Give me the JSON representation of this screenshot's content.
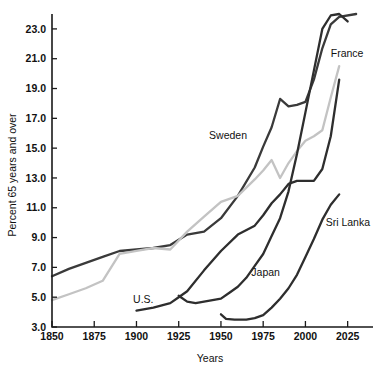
{
  "chart_data": {
    "type": "line",
    "title": "",
    "xlabel": "Years",
    "ylabel": "Percent 65 years and over",
    "xlim": [
      1850,
      2040
    ],
    "ylim": [
      3.0,
      24.0
    ],
    "grid": false,
    "legend_position": "inline-labels",
    "xticks": [
      1850,
      1875,
      1900,
      1925,
      1950,
      1975,
      2000,
      2025
    ],
    "xtick_labels": [
      "1850",
      "1875",
      "1900",
      "1925",
      "1950",
      "1975",
      "2000",
      "2025"
    ],
    "yticks": [
      3.0,
      5.0,
      7.0,
      9.0,
      11.0,
      13.0,
      15.0,
      17.0,
      19.0,
      21.0,
      23.0
    ],
    "ytick_labels": [
      "3.0",
      "5.0",
      "7.0",
      "9.0",
      "11.0",
      "13.0",
      "15.0",
      "17.0",
      "19.0",
      "21.0",
      "23.0"
    ],
    "series": [
      {
        "name": "Sweden",
        "color": "#3a3a3a",
        "label_x": 1943,
        "label_y": 15.6,
        "x": [
          1850,
          1860,
          1870,
          1880,
          1890,
          1900,
          1910,
          1920,
          1930,
          1940,
          1950,
          1960,
          1970,
          1975,
          1980,
          1985,
          1990,
          1995,
          2000,
          2005,
          2010,
          2015,
          2020,
          2030
        ],
        "y": [
          6.4,
          6.9,
          7.3,
          7.7,
          8.1,
          8.2,
          8.3,
          8.5,
          9.2,
          9.4,
          10.3,
          11.8,
          13.7,
          15.1,
          16.4,
          18.3,
          17.8,
          17.9,
          18.1,
          19.6,
          21.7,
          23.3,
          23.8,
          24.0
        ]
      },
      {
        "name": "France",
        "color": "#c3c3c3",
        "label_x": 2015,
        "label_y": 21.1,
        "x": [
          1850,
          1860,
          1870,
          1880,
          1890,
          1900,
          1910,
          1920,
          1930,
          1940,
          1950,
          1960,
          1970,
          1975,
          1980,
          1985,
          1990,
          1995,
          2000,
          2005,
          2010,
          2015,
          2020
        ],
        "y": [
          4.8,
          5.2,
          5.6,
          6.1,
          7.9,
          8.1,
          8.3,
          8.2,
          9.4,
          10.4,
          11.4,
          11.8,
          12.9,
          13.5,
          14.2,
          13.0,
          14.0,
          14.8,
          15.5,
          15.8,
          16.2,
          18.4,
          20.5
        ]
      },
      {
        "name": "U.S.",
        "color": "#2e2e2e",
        "label_x": 1898,
        "label_y": 4.6,
        "x": [
          1900,
          1910,
          1920,
          1925,
          1930,
          1940,
          1950,
          1960,
          1970,
          1975,
          1980,
          1985,
          1990,
          1995,
          2000,
          2005,
          2010,
          2015,
          2020
        ],
        "y": [
          4.1,
          4.3,
          4.6,
          5.0,
          5.4,
          6.8,
          8.1,
          9.2,
          9.8,
          10.5,
          11.3,
          11.9,
          12.6,
          12.8,
          12.8,
          12.8,
          13.6,
          15.8,
          19.6
        ]
      },
      {
        "name": "Japan",
        "color": "#2e2e2e",
        "label_x": 1968,
        "label_y": 6.4,
        "x": [
          1925,
          1930,
          1935,
          1940,
          1950,
          1955,
          1960,
          1965,
          1970,
          1975,
          1980,
          1985,
          1990,
          1995,
          2000,
          2005,
          2010,
          2015,
          2020,
          2025
        ],
        "y": [
          5.1,
          4.7,
          4.6,
          4.7,
          4.9,
          5.3,
          5.7,
          6.3,
          7.1,
          7.9,
          9.1,
          10.3,
          12.1,
          14.6,
          17.4,
          20.2,
          23.0,
          23.9,
          24.0,
          23.5
        ]
      },
      {
        "name": "Sri Lanka",
        "color": "#2e2e2e",
        "label_x": 2012,
        "label_y": 9.8,
        "x": [
          1950,
          1953,
          1958,
          1965,
          1970,
          1975,
          1980,
          1985,
          1990,
          1995,
          2000,
          2005,
          2010,
          2015,
          2020
        ],
        "y": [
          3.85,
          3.55,
          3.5,
          3.5,
          3.6,
          3.8,
          4.3,
          4.9,
          5.6,
          6.5,
          7.7,
          8.9,
          10.2,
          11.2,
          11.9
        ]
      }
    ]
  },
  "axes": {
    "x_title": "Years",
    "y_title": "Percent 65 years and over"
  }
}
